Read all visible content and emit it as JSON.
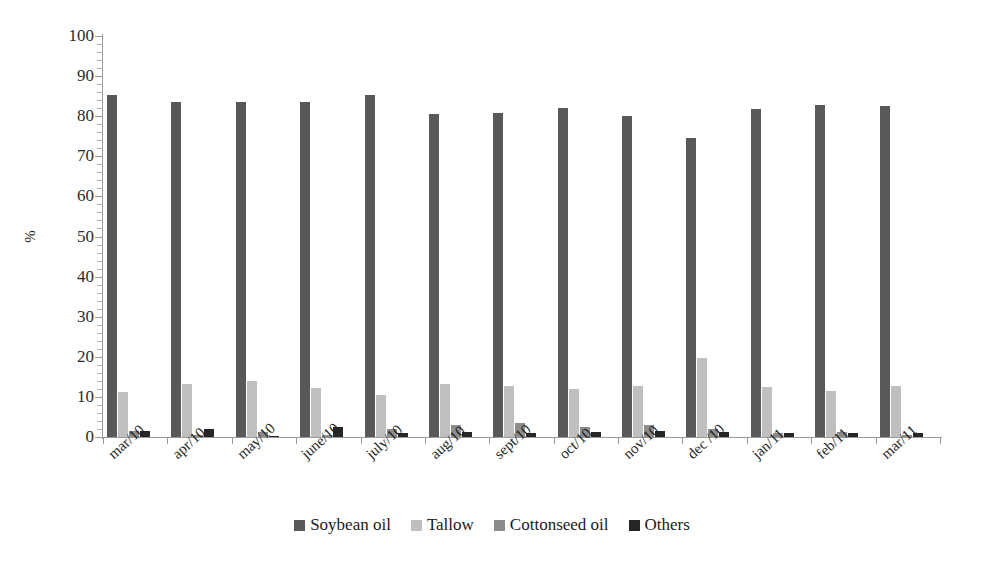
{
  "chart_data": {
    "type": "bar",
    "title": "",
    "subtitle": "",
    "xlabel": "",
    "ylabel": "%",
    "ylim": [
      0,
      100
    ],
    "ytick_step": 10,
    "yticks": [
      "0",
      "10",
      "20",
      "30",
      "40",
      "50",
      "60",
      "70",
      "80",
      "90",
      "100"
    ],
    "minor_ticks": true,
    "grid": false,
    "legend_position": "bottom",
    "grouping": "grouped",
    "categories": [
      "mar/10",
      "apr/10",
      "may/10",
      "june/10",
      "july/10",
      "aug/10",
      "sept/10",
      "oct/10",
      "nov/10",
      "dec /10",
      "jan/11",
      "feb/11",
      "mar/11"
    ],
    "series": [
      {
        "name": "Soybean oil",
        "color": "#595959",
        "values": [
          85.4,
          83.6,
          83.5,
          83.6,
          85.3,
          80.6,
          80.8,
          82.0,
          80.0,
          74.5,
          81.9,
          82.8,
          82.5
        ]
      },
      {
        "name": "Tallow",
        "color": "#bfbfbf",
        "values": [
          11.2,
          13.3,
          14.0,
          12.2,
          10.6,
          13.2,
          12.6,
          12.0,
          12.8,
          19.8,
          12.5,
          11.4,
          12.7
        ]
      },
      {
        "name": "Cottonseed oil",
        "color": "#8c8c8c",
        "values": [
          1.5,
          0.4,
          1.2,
          0.4,
          1.9,
          3.1,
          3.6,
          2.4,
          3.0,
          2.1,
          1.1,
          1.2,
          0.5
        ]
      },
      {
        "name": "Others",
        "color": "#262626",
        "values": [
          1.5,
          2.1,
          0.3,
          2.6,
          0.9,
          1.3,
          0.9,
          1.3,
          1.6,
          1.3,
          0.9,
          1.0,
          1.1
        ]
      }
    ]
  }
}
